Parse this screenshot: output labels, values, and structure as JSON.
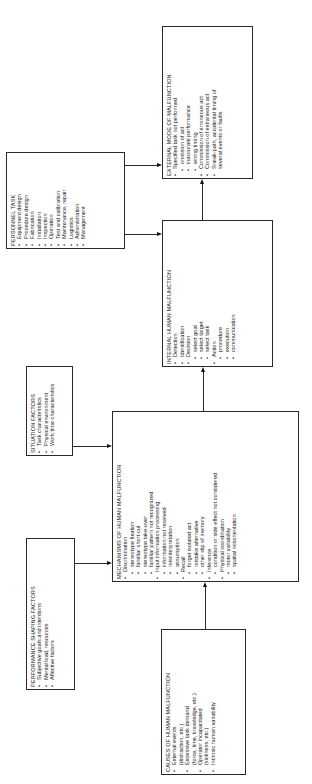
{
  "diagram": {
    "external": {
      "title": "EXTERNAL MODE OF MALFUNCTION",
      "items": [
        {
          "text": "Specified task not performed",
          "level": 0
        },
        {
          "text": "omission of act",
          "level": 1
        },
        {
          "text": "inaccurate performance",
          "level": 1
        },
        {
          "text": "wrong timing",
          "level": 1
        },
        {
          "text": "Commission of erroneous act",
          "level": 0
        },
        {
          "text": "Commission of extraneous act",
          "level": 0
        },
        {
          "text": "Sneak-path, accidental timing of",
          "level": 0
        },
        {
          "text": "several events or faults",
          "level": "cont"
        }
      ]
    },
    "personnel": {
      "title": "PERSONNEL TASK",
      "items": [
        {
          "text": "Equipment design",
          "level": 0
        },
        {
          "text": "Procedure design",
          "level": 0
        },
        {
          "text": "Fabrication",
          "level": 0
        },
        {
          "text": "Installation",
          "level": 0
        },
        {
          "text": "Inspection",
          "level": 0
        },
        {
          "text": "Operation",
          "level": 0
        },
        {
          "text": "Test and calibration",
          "level": 0
        },
        {
          "text": "Maintenance, repair",
          "level": 0
        },
        {
          "text": "Logistics",
          "level": 0
        },
        {
          "text": "Administration",
          "level": 0
        },
        {
          "text": "Management",
          "level": 0
        }
      ]
    },
    "internal": {
      "title": "INTERNAL HUMAN MALFUNCTION",
      "items": [
        {
          "text": "Detection",
          "level": 0
        },
        {
          "text": "Identification",
          "level": 0
        },
        {
          "text": "Decision",
          "level": 0
        },
        {
          "text": "select goal",
          "level": 1
        },
        {
          "text": "select target",
          "level": 1
        },
        {
          "text": "select task",
          "level": 1
        },
        {
          "text": "Action",
          "level": 0
        },
        {
          "text": "procedure",
          "level": 1
        },
        {
          "text": "execution",
          "level": 1
        },
        {
          "text": "communication",
          "level": 1
        }
      ]
    },
    "situation": {
      "title": "SITUATION FACTORS",
      "items": [
        {
          "text": "Task characteristics",
          "level": 0
        },
        {
          "text": "Physical environment",
          "level": 0
        },
        {
          "text": "Work time characteristics",
          "level": 0
        }
      ]
    },
    "mechanisms": {
      "title": "MECHANISMS OF HUMAN MALFUNCTION",
      "items": [
        {
          "text": "Discrimination",
          "level": 0
        },
        {
          "text": "stereotype fixation",
          "level": 1
        },
        {
          "text": "familiar short-cut",
          "level": 1
        },
        {
          "text": "stereotype take-over",
          "level": 1
        },
        {
          "text": "familiar pattern not recognized",
          "level": 1
        },
        {
          "text": "Input information processing",
          "level": 0
        },
        {
          "text": "information not received",
          "level": 1
        },
        {
          "text": "misinterpretation",
          "level": 1
        },
        {
          "text": "assumption",
          "level": 1
        },
        {
          "text": "Recall",
          "level": 0
        },
        {
          "text": "forget isolated act",
          "level": 1
        },
        {
          "text": "mistake alternative",
          "level": 1
        },
        {
          "text": "other slip of memory",
          "level": 1
        },
        {
          "text": "Inference",
          "level": 0
        },
        {
          "text": "condition or side effect not considered",
          "level": 1
        },
        {
          "text": "Physical coordination",
          "level": 0
        },
        {
          "text": "motor variability",
          "level": 1
        },
        {
          "text": "spatial misorientation",
          "level": 1
        }
      ]
    },
    "psf": {
      "title": "PERFORMANCE SHAPING FACTORS",
      "items": [
        {
          "text": "Subjective goals and intentions",
          "level": 0
        },
        {
          "text": "Mental load, resources",
          "level": 0
        },
        {
          "text": "Affective factors",
          "level": 0
        }
      ]
    },
    "causes": {
      "title": "CAUSES OF HUMAN MALFUNCTION",
      "items": [
        {
          "text": "External events",
          "level": 0
        },
        {
          "text": "(distraction, etc.)",
          "level": "cont"
        },
        {
          "text": "Excessive task demand",
          "level": 0
        },
        {
          "text": "(force, time, knowledge, etc.)",
          "level": "cont"
        },
        {
          "text": "Operator incapacitated",
          "level": 0
        },
        {
          "text": "(sickness, etc.)",
          "level": "cont"
        },
        {
          "text": "Intrinsic human variability",
          "level": 0
        }
      ]
    }
  }
}
